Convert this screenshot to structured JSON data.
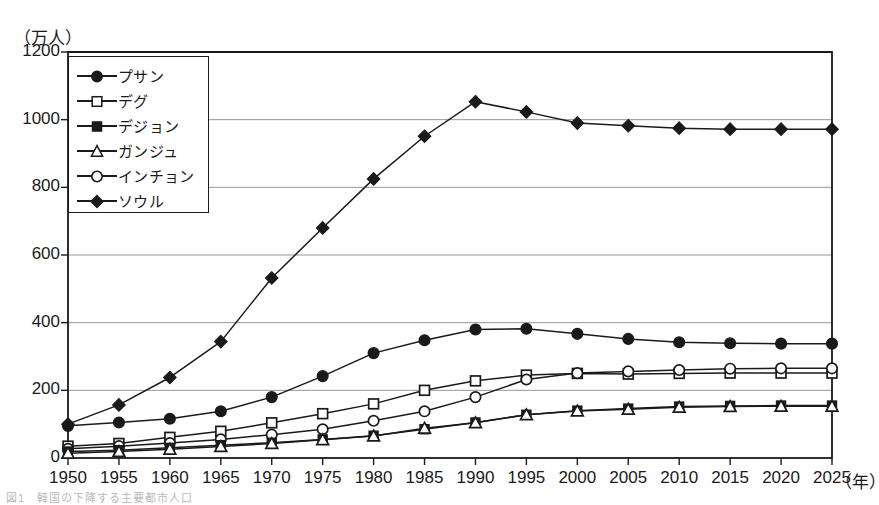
{
  "figure": {
    "y_axis_unit": "（万人）",
    "x_axis_unit": "（年）",
    "caption": "図1　韓国の下降する主要都市人口"
  },
  "legend": {
    "entries": [
      {
        "label": "プサン",
        "marker": "filled-circle",
        "icon": "legend-marker-filled-circle"
      },
      {
        "label": "デグ",
        "marker": "open-square",
        "icon": "legend-marker-open-square"
      },
      {
        "label": "デジョン",
        "marker": "filled-square",
        "icon": "legend-marker-filled-square"
      },
      {
        "label": "ガンジュ",
        "marker": "open-triangle",
        "icon": "legend-marker-open-triangle"
      },
      {
        "label": "インチョン",
        "marker": "open-circle",
        "icon": "legend-marker-open-circle"
      },
      {
        "label": "ソウル",
        "marker": "filled-diamond",
        "icon": "legend-marker-filled-diamond"
      }
    ]
  },
  "chart_data": {
    "type": "line",
    "title": "",
    "xlabel": "（年）",
    "ylabel": "（万人）",
    "xlim": [
      1950,
      2025
    ],
    "ylim": [
      0,
      1200
    ],
    "ytick_step": 200,
    "grid": true,
    "legend_position": "upper-left-inside",
    "categories": [
      1950,
      1955,
      1960,
      1965,
      1970,
      1975,
      1980,
      1985,
      1990,
      1995,
      2000,
      2005,
      2010,
      2015,
      2020,
      2025
    ],
    "yticks": [
      0,
      200,
      400,
      600,
      800,
      1000,
      1200
    ],
    "xticks": [
      1950,
      1955,
      1960,
      1965,
      1970,
      1975,
      1980,
      1985,
      1990,
      1995,
      2000,
      2005,
      2010,
      2015,
      2020,
      2025
    ],
    "series": [
      {
        "name": "ソウル",
        "marker": "filled-diamond",
        "values": [
          100,
          157,
          238,
          344,
          532,
          680,
          825,
          951,
          1053,
          1023,
          990,
          982,
          975,
          972,
          972,
          972
        ]
      },
      {
        "name": "プサン",
        "marker": "filled-circle",
        "values": [
          95,
          105,
          116,
          138,
          180,
          242,
          310,
          348,
          380,
          382,
          367,
          352,
          342,
          339,
          338,
          338
        ]
      },
      {
        "name": "デグ",
        "marker": "open-square",
        "values": [
          35,
          43,
          61,
          79,
          104,
          131,
          160,
          200,
          228,
          245,
          250,
          248,
          250,
          251,
          251,
          251
        ]
      },
      {
        "name": "インチョン",
        "marker": "open-circle",
        "values": [
          27,
          35,
          44,
          55,
          69,
          85,
          110,
          138,
          180,
          232,
          251,
          256,
          260,
          264,
          265,
          265
        ]
      },
      {
        "name": "デジョン",
        "marker": "filled-square",
        "values": [
          19,
          23,
          30,
          38,
          45,
          55,
          66,
          85,
          105,
          128,
          140,
          146,
          152,
          154,
          155,
          155
        ]
      },
      {
        "name": "ガンジュ",
        "marker": "open-triangle",
        "values": [
          14,
          19,
          26,
          34,
          43,
          54,
          65,
          88,
          104,
          128,
          139,
          144,
          150,
          152,
          153,
          153
        ]
      }
    ]
  }
}
